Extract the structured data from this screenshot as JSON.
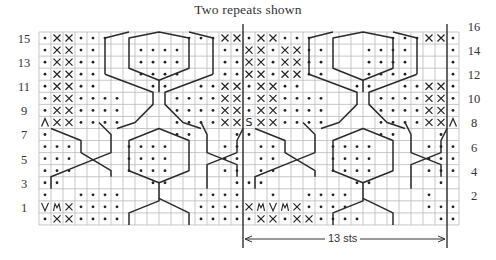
{
  "title": "Two repeats shown",
  "grid": {
    "columns": 35,
    "rows": 16,
    "origin_x": 39,
    "origin_y": 32,
    "cell_w": 12,
    "cell_h": 12.06,
    "repeat_line_x": 243,
    "right_line_x": 447
  },
  "row_labels_left": [
    "15",
    "13",
    "11",
    "9",
    "7",
    "5",
    "3",
    "1"
  ],
  "row_labels_right": [
    "16",
    "14",
    "12",
    "10",
    "8",
    "6",
    "4",
    "2"
  ],
  "repeat_width_label": "13 sts",
  "legend_symbols": {
    ".": "purl-dot",
    "x": "twisted-stitch-x",
    "v": "slip-v",
    "m": "make-one-m",
    "^": "decrease-caret",
    "s": "special-s"
  },
  "chart_rows": {
    "16": ".xx...      ...xx.xx...      ...xx.",
    "15": ".xx..   ....   ..xx.xx..   ....   ..xx.",
    "14": ".xx..   ....   ..xx.xx..   ....   ..xx.",
    "13": ".xx..   ....   ..xx.xx..   ....   ..xx.",
    "12": ".xx..    ..  ..xx.xx..    ..  ..xx.",
    "11": ".xx....    ....xx.xx....    ....xx.",
    "10": ".xx....    ....xx.xx....    ....xx.",
    "9": "^xx....    ....xxsxx....    ....xx^",
    "8": ".          ..   ..          ..   .",
    "7": "...    ....    .. ..    ....    ...",
    "6": "...    ....    .. ..    ....    ...",
    "5": "...    ....    .. ..    ....    ...",
    "4": "..       ..     ...       ..     .",
    "3": ".  ....      ....  .  ....      .",
    "2": "vmx....      ....xmvmx....      ....xmv",
    "1": ".xx....      .....xx.xx....      .....xx."
  }
}
